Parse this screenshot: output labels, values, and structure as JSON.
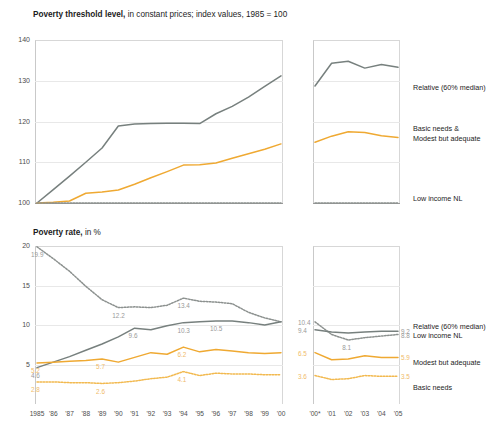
{
  "colors": {
    "gray": "#77807e",
    "gray_dotted": "#8c918f",
    "orange": "#efa932",
    "orange_dotted": "#f2b94f",
    "grid": "#e8e8e8",
    "axis": "#c9c9c9",
    "text": "#1c1c1c"
  },
  "top": {
    "title_bold": "Poverty threshold level,",
    "title_rest": " in constant prices; index values, 1985 = 100",
    "legend": [
      {
        "label": "Relative (60% median)",
        "name": "legend-relative"
      },
      {
        "label": "Basic needs &",
        "label2": "Modest but adequate",
        "name": "legend-basic-modest"
      },
      {
        "label": "Low income NL",
        "name": "legend-low-income"
      }
    ]
  },
  "bottom": {
    "title_bold": "Poverty rate,",
    "title_rest": " in %",
    "legend": [
      {
        "label": "Relative (60% median)",
        "name": "legend-relative"
      },
      {
        "label": "Low income NL",
        "name": "legend-low-income"
      },
      {
        "label": "Modest but adequate",
        "name": "legend-modest"
      },
      {
        "label": "Basic needs",
        "name": "legend-basic"
      }
    ]
  },
  "chart_data": [
    {
      "type": "line",
      "title": "Poverty threshold level, in constant prices; index values, 1985 = 100",
      "ylabel": "",
      "xlabel": "",
      "ylim": [
        100,
        140
      ],
      "yticks": [
        100,
        110,
        120,
        130,
        140
      ],
      "grid": true,
      "legend_position": "right",
      "panels": [
        {
          "name": "left-panel",
          "x": [
            "1985",
            "'86",
            "'87",
            "'88",
            "'89",
            "'90",
            "'91",
            "'92",
            "'93",
            "'94",
            "'95",
            "'96",
            "'97",
            "'98",
            "'99",
            "'00"
          ],
          "xticks": [
            "1985",
            "'86",
            "'87",
            "'88",
            "'89",
            "'90",
            "'91",
            "'92",
            "'93",
            "'94",
            "'95",
            "'96",
            "'97",
            "'98",
            "'99",
            "'00"
          ],
          "series": [
            {
              "name": "Relative (60% median)",
              "style": "solid",
              "color": "#77807e",
              "values": [
                100.0,
                103.3,
                106.6,
                110.0,
                113.5,
                118.9,
                119.4,
                119.5,
                119.6,
                119.6,
                119.5,
                121.9,
                123.7,
                126.0,
                128.6,
                131.2
              ]
            },
            {
              "name": "Basic needs & Modest but adequate",
              "style": "solid",
              "color": "#efa932",
              "values": [
                100.0,
                100.2,
                100.5,
                102.4,
                102.7,
                103.2,
                104.6,
                106.2,
                107.7,
                109.3,
                109.4,
                109.8,
                111.0,
                112.1,
                113.2,
                114.5
              ]
            },
            {
              "name": "Low income NL",
              "style": "dotted",
              "color": "#8c918f",
              "values": [
                100.0,
                100.0,
                100.0,
                100.0,
                100.0,
                100.0,
                100.0,
                100.0,
                100.0,
                100.0,
                100.0,
                100.0,
                100.0,
                100.0,
                100.0,
                100.0
              ]
            }
          ]
        },
        {
          "name": "right-panel",
          "x": [
            "'00*",
            "'01",
            "'02",
            "'03",
            "'04",
            "'05"
          ],
          "xticks": [
            "'00*",
            "'01",
            "'02",
            "'03",
            "'04",
            "'05"
          ],
          "series": [
            {
              "name": "Relative (60% median)",
              "style": "solid",
              "color": "#77807e",
              "values": [
                128.7,
                134.3,
                134.8,
                133.1,
                134.0,
                133.3
              ]
            },
            {
              "name": "Basic needs & Modest but adequate",
              "style": "solid",
              "color": "#efa932",
              "values": [
                114.9,
                116.4,
                117.5,
                117.3,
                116.5,
                116.1
              ]
            },
            {
              "name": "Low income NL",
              "style": "dotted",
              "color": "#8c918f",
              "values": [
                100.0,
                100.0,
                100.0,
                100.0,
                100.0,
                100.0
              ]
            }
          ]
        }
      ]
    },
    {
      "type": "line",
      "title": "Poverty rate, in %",
      "ylabel": "",
      "xlabel": "",
      "ylim": [
        0,
        20
      ],
      "yticks": [
        5,
        10,
        15,
        20
      ],
      "grid": true,
      "legend_position": "right",
      "panels": [
        {
          "name": "left-panel",
          "x": [
            "1985",
            "'86",
            "'87",
            "'88",
            "'89",
            "'90",
            "'91",
            "'92",
            "'93",
            "'94",
            "'95",
            "'96",
            "'97",
            "'98",
            "'99",
            "'00"
          ],
          "xticks": [
            "1985",
            "'86",
            "'87",
            "'88",
            "'89",
            "'90",
            "'91",
            "'92",
            "'93",
            "'94",
            "'95",
            "'96",
            "'97",
            "'98",
            "'99",
            "'00"
          ],
          "series": [
            {
              "name": "Low income NL",
              "style": "dotted",
              "color": "#8c918f",
              "values": [
                19.9,
                18.4,
                16.8,
                14.9,
                13.2,
                12.2,
                12.3,
                12.2,
                12.5,
                13.4,
                13.0,
                12.9,
                12.7,
                11.6,
                10.9,
                10.4
              ]
            },
            {
              "name": "Relative (60% median)",
              "style": "solid",
              "color": "#77807e",
              "values": [
                4.6,
                5.3,
                6.0,
                6.8,
                7.6,
                8.5,
                9.6,
                9.4,
                9.9,
                10.3,
                10.4,
                10.5,
                10.5,
                10.3,
                10.0,
                10.4
              ]
            },
            {
              "name": "Modest but adequate",
              "style": "solid",
              "color": "#efa932",
              "values": [
                5.2,
                5.3,
                5.4,
                5.5,
                5.7,
                5.3,
                5.9,
                6.5,
                6.3,
                7.2,
                6.6,
                6.9,
                6.7,
                6.5,
                6.4,
                6.5
              ]
            },
            {
              "name": "Basic needs",
              "style": "dotted",
              "color": "#f2b94f",
              "values": [
                2.8,
                2.8,
                2.7,
                2.7,
                2.6,
                2.7,
                2.9,
                3.2,
                3.4,
                4.1,
                3.6,
                3.9,
                3.8,
                3.8,
                3.7,
                3.7
              ]
            }
          ],
          "annotations": [
            {
              "text": "19.9",
              "series": "Low income NL",
              "x_index": 0
            },
            {
              "text": "12.2",
              "series": "Low income NL",
              "x_index": 5
            },
            {
              "text": "13.4",
              "series": "Low income NL",
              "x_index": 9
            },
            {
              "text": "9.6",
              "series": "Relative (60% median)",
              "x_index": 6
            },
            {
              "text": "10.3",
              "series": "Relative (60% median)",
              "x_index": 9
            },
            {
              "text": "10.5",
              "series": "Relative (60% median)",
              "x_index": 11
            },
            {
              "text": "4.6",
              "series": "Relative (60% median)",
              "x_index": 0
            },
            {
              "text": "5.2",
              "series": "Modest but adequate",
              "x_index": 0
            },
            {
              "text": "5.7",
              "series": "Modest but adequate",
              "x_index": 4
            },
            {
              "text": "6.2",
              "series": "Modest but adequate",
              "x_index": 9
            },
            {
              "text": "2.8",
              "series": "Basic needs",
              "x_index": 0
            },
            {
              "text": "2.6",
              "series": "Basic needs",
              "x_index": 4
            },
            {
              "text": "4.1",
              "series": "Basic needs",
              "x_index": 9
            }
          ]
        },
        {
          "name": "right-panel",
          "x": [
            "'00*",
            "'01",
            "'02",
            "'03",
            "'04",
            "'05"
          ],
          "xticks": [
            "'00*",
            "'01",
            "'02",
            "'03",
            "'04",
            "'05"
          ],
          "series": [
            {
              "name": "Low income NL",
              "style": "dotted",
              "color": "#8c918f",
              "values": [
                10.4,
                8.8,
                8.1,
                8.4,
                8.6,
                8.8
              ]
            },
            {
              "name": "Relative (60% median)",
              "style": "solid",
              "color": "#77807e",
              "values": [
                9.4,
                9.1,
                9.0,
                9.1,
                9.2,
                9.2
              ]
            },
            {
              "name": "Modest but adequate",
              "style": "solid",
              "color": "#efa932",
              "values": [
                6.5,
                5.6,
                5.7,
                6.1,
                5.9,
                5.9
              ]
            },
            {
              "name": "Basic needs",
              "style": "dotted",
              "color": "#f2b94f",
              "values": [
                3.6,
                3.1,
                3.2,
                3.6,
                3.5,
                3.5
              ]
            }
          ],
          "annotations": [
            {
              "text": "10.4",
              "series": "Low income NL",
              "x_index": 0,
              "side": "left"
            },
            {
              "text": "9.4",
              "series": "Relative (60% median)",
              "x_index": 0,
              "side": "left"
            },
            {
              "text": "8.1",
              "series": "Low income NL",
              "x_index": 2
            },
            {
              "text": "6.5",
              "series": "Modest but adequate",
              "x_index": 0,
              "side": "left"
            },
            {
              "text": "3.6",
              "series": "Basic needs",
              "x_index": 0,
              "side": "left"
            },
            {
              "text": "9.2",
              "series": "Relative (60% median)",
              "x_index": 5,
              "side": "right"
            },
            {
              "text": "8.8",
              "series": "Low income NL",
              "x_index": 5,
              "side": "right"
            },
            {
              "text": "5.9",
              "series": "Modest but adequate",
              "x_index": 5,
              "side": "right"
            },
            {
              "text": "3.5",
              "series": "Basic needs",
              "x_index": 5,
              "side": "right"
            }
          ]
        }
      ]
    }
  ]
}
